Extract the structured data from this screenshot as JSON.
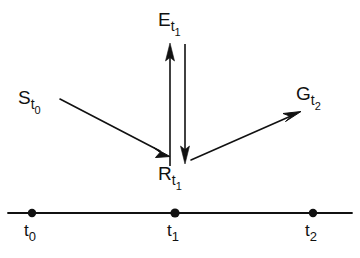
{
  "figure": {
    "background_color": "#ffffff",
    "ink_color": "#111111",
    "width": 360,
    "height": 258
  },
  "nodes": [
    {
      "id": "E",
      "name": "event-node-E",
      "base": "E",
      "sub": "t",
      "subsub": "1",
      "x": 158,
      "y": 10
    },
    {
      "id": "S",
      "name": "event-node-S",
      "base": "S",
      "sub": "t",
      "subsub": "0",
      "x": 18,
      "y": 88
    },
    {
      "id": "G",
      "name": "event-node-G",
      "base": "G",
      "sub": "t",
      "subsub": "2",
      "x": 296,
      "y": 84
    },
    {
      "id": "R",
      "name": "event-node-R",
      "base": "R",
      "sub": "t",
      "subsub": "1",
      "x": 158,
      "y": 164
    }
  ],
  "arrows": [
    {
      "name": "arrow-S-to-R",
      "from": "S",
      "to": "R",
      "x1": 60,
      "y1": 99,
      "x2": 168,
      "y2": 155
    },
    {
      "name": "arrow-R-to-E",
      "from": "R",
      "to": "E",
      "x1": 170,
      "y1": 166,
      "x2": 170,
      "y2": 44
    },
    {
      "name": "arrow-E-to-R",
      "from": "E",
      "to": "R",
      "x1": 185,
      "y1": 44,
      "x2": 185,
      "y2": 163
    },
    {
      "name": "arrow-R-to-G",
      "from": "R",
      "to": "G",
      "x1": 191,
      "y1": 160,
      "x2": 300,
      "y2": 111
    }
  ],
  "timeline": {
    "name": "timeline-axis",
    "x_start": 8,
    "x_end": 352,
    "y": 213,
    "ticks": [
      {
        "name": "timeline-tick-t0",
        "base": "t",
        "sub": "0",
        "x": 32,
        "label_x": 24,
        "label_y": 222
      },
      {
        "name": "timeline-tick-t1",
        "base": "t",
        "sub": "1",
        "x": 175,
        "label_x": 167,
        "label_y": 222
      },
      {
        "name": "timeline-tick-t2",
        "base": "t",
        "sub": "2",
        "x": 313,
        "label_x": 305,
        "label_y": 222
      }
    ]
  }
}
